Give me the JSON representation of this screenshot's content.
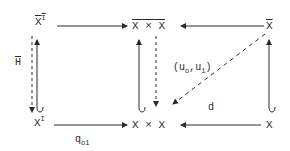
{
  "diagram": {
    "type": "commutative-diagram",
    "nodes": {
      "top_left": {
        "base": "X",
        "sup": "I",
        "overline": true
      },
      "top_middle": {
        "text": "X × X",
        "overline": true
      },
      "top_right": {
        "text": "X",
        "overline": true
      },
      "bottom_left": {
        "base": "X",
        "sup": "I"
      },
      "bottom_middle": {
        "text": "X × X"
      },
      "bottom_right": {
        "text": "X"
      }
    },
    "labels": {
      "left_dashed": "H",
      "middle_dashed": {
        "open": "(u",
        "sub0": "o",
        "comma": ",u",
        "sub1": "1",
        "close": ")"
      },
      "bottom_left_arrow": {
        "base": "q",
        "sub": "o1"
      },
      "diagonal": "d"
    },
    "arrows": [
      {
        "from": "top_left",
        "to": "top_middle",
        "style": "solid"
      },
      {
        "from": "top_right",
        "to": "top_middle",
        "style": "solid"
      },
      {
        "from": "bottom_left",
        "to": "bottom_middle",
        "style": "solid",
        "label": "q_o1"
      },
      {
        "from": "bottom_right",
        "to": "bottom_middle",
        "style": "solid"
      },
      {
        "from": "bottom_left",
        "to": "top_left",
        "style": "hook"
      },
      {
        "from": "bottom_middle",
        "to": "top_middle",
        "style": "hook"
      },
      {
        "from": "bottom_right",
        "to": "top_right",
        "style": "hook"
      },
      {
        "from": "top_left",
        "to": "bottom_left",
        "style": "dashed",
        "label": "H"
      },
      {
        "from": "top_middle",
        "to": "bottom_middle",
        "style": "dashed",
        "label": "(u_o,u_1)"
      },
      {
        "from": "top_right",
        "to": "bottom_middle",
        "style": "dashed",
        "label": "d"
      }
    ],
    "colors": {
      "ink": "#2a2a2a",
      "background": "#ffffff"
    }
  }
}
